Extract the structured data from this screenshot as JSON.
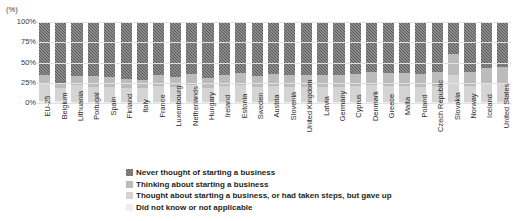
{
  "title_sliver": "",
  "axis_unit": "(%)",
  "legend": {
    "items": [
      {
        "key": "never",
        "label": "Never thought of starting a business",
        "color": "#5a5a5a"
      },
      {
        "key": "thinking",
        "label": "Thinking about starting a business",
        "color": "#bcbcbc"
      },
      {
        "key": "gaveup",
        "label": "Thought about starting a business, or had taken steps,  but gave up",
        "color": "#d4d4d4"
      },
      {
        "key": "na",
        "label": "Did not know or not applicable",
        "color": "#ededed"
      }
    ]
  },
  "chart_data": {
    "type": "bar",
    "stacked": true,
    "stack_mode": "percent",
    "title": "",
    "xlabel": "",
    "ylabel": "(%)",
    "ylim": [
      0,
      100
    ],
    "yticks": [
      "0%",
      "25%",
      "50%",
      "75%",
      "100%"
    ],
    "ytick_values": [
      0,
      25,
      50,
      75,
      100
    ],
    "grid": true,
    "legend_position": "bottom",
    "categories": [
      "EU-25",
      "Belgium",
      "Lithuania",
      "Portugal",
      "Spain",
      "Finland",
      "Italy",
      "France",
      "Luxembourg",
      "Netherlands",
      "Hungary",
      "Ireland",
      "Estonia",
      "Sweden",
      "Austria",
      "Slovenia",
      "United Kingdom",
      "Latvia",
      "Germany",
      "Cyprus",
      "Denmark",
      "Greece",
      "Malta",
      "Poland",
      "Czech Republic",
      "Slovakia",
      "Norway",
      "Iceland",
      "United States"
    ],
    "series": [
      {
        "name": "Never thought of starting a business",
        "color": "#5a5a5a",
        "values": [
          65,
          75,
          67,
          67,
          68,
          70,
          72,
          66,
          68,
          64,
          69,
          65,
          63,
          67,
          64,
          66,
          65,
          65,
          65,
          64,
          62,
          63,
          63,
          64,
          62,
          40,
          62,
          57,
          55
        ]
      },
      {
        "name": "Thinking about starting a business",
        "color": "#bcbcbc",
        "values": [
          12,
          6,
          11,
          13,
          12,
          11,
          10,
          13,
          12,
          14,
          12,
          14,
          15,
          13,
          15,
          14,
          15,
          15,
          15,
          15,
          16,
          16,
          16,
          16,
          17,
          25,
          17,
          19,
          20
        ]
      },
      {
        "name": "Thought about starting a business, or had taken steps,  but gave up",
        "color": "#d4d4d4",
        "values": [
          21,
          17,
          21,
          19,
          19,
          18,
          17,
          20,
          19,
          21,
          18,
          20,
          21,
          19,
          20,
          19,
          19,
          19,
          19,
          20,
          21,
          20,
          20,
          19,
          20,
          34,
          20,
          23,
          24
        ]
      },
      {
        "name": "Did not know or not applicable",
        "color": "#ededed",
        "values": [
          2,
          2,
          1,
          1,
          1,
          1,
          1,
          1,
          1,
          1,
          1,
          1,
          1,
          1,
          1,
          1,
          1,
          1,
          1,
          1,
          1,
          1,
          1,
          1,
          1,
          1,
          1,
          1,
          1
        ]
      }
    ]
  }
}
